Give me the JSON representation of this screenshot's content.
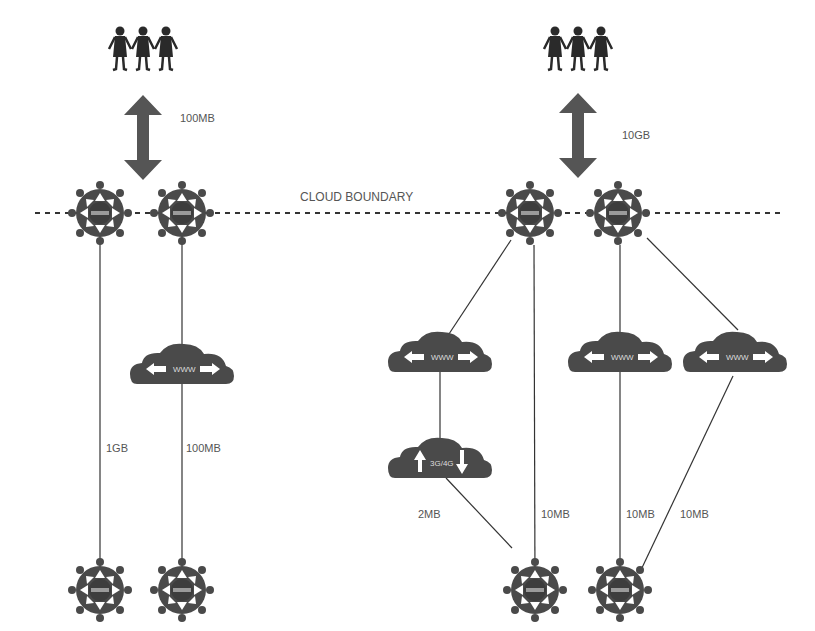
{
  "diagram": {
    "boundary_label": "CLOUD BOUNDARY",
    "colors": {
      "background": "#ffffff",
      "node": "#4a4a4a",
      "line": "#333333",
      "label": "#555555"
    },
    "left_group": {
      "users_link_label": "100MB",
      "links": [
        {
          "label": "1GB"
        },
        {
          "label": "100MB"
        }
      ],
      "cloud_label": "WWW"
    },
    "right_group": {
      "users_link_label": "10GB",
      "clouds": [
        {
          "label": "WWW"
        },
        {
          "label": "WWW"
        },
        {
          "label": "WWW"
        },
        {
          "label": "3G/4G"
        }
      ],
      "links": [
        {
          "label": "2MB"
        },
        {
          "label": "10MB"
        },
        {
          "label": "10MB"
        },
        {
          "label": "10MB"
        }
      ]
    },
    "router_label": "ROUTER",
    "icons": [
      "people-icon",
      "double-arrow-icon",
      "router-icon",
      "cloud-icon"
    ]
  }
}
